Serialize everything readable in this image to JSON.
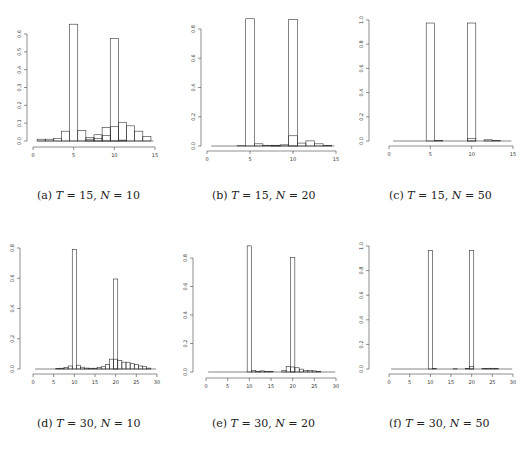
{
  "figure": {
    "panels": [
      {
        "id": "a",
        "caption_label": "(a)",
        "caption_T": "15",
        "caption_N": "10"
      },
      {
        "id": "b",
        "caption_label": "(b)",
        "caption_T": "15",
        "caption_N": "20"
      },
      {
        "id": "c",
        "caption_label": "(c)",
        "caption_T": "15",
        "caption_N": "50"
      },
      {
        "id": "d",
        "caption_label": "(d)",
        "caption_T": "30",
        "caption_N": "10"
      },
      {
        "id": "e",
        "caption_label": "(e)",
        "caption_T": "30",
        "caption_N": "20"
      },
      {
        "id": "f",
        "caption_label": "(f)",
        "caption_T": "30",
        "caption_N": "50"
      }
    ]
  },
  "chart_data": [
    {
      "type": "bar",
      "title": "(a) T = 15, N = 10",
      "xlabel": "",
      "ylabel": "",
      "xlim": [
        0,
        15
      ],
      "ylim": [
        0,
        0.6
      ],
      "xticks": [
        0,
        5,
        10,
        15
      ],
      "yticks": [
        0.0,
        0.1,
        0.2,
        0.3,
        0.4,
        0.5,
        0.6
      ],
      "grid": false,
      "layout": {
        "ox": 27,
        "x0px": 33,
        "x1px": 155,
        "y0px": 141,
        "ytopval": 0.6,
        "ytoppx": 34,
        "axisy": 147
      },
      "series": [
        {
          "name": "changepoint 1",
          "bins": [
            [
              4.5,
              5.5,
              0.655
            ],
            [
              3.5,
              4.5,
              0.055
            ],
            [
              5.5,
              6.5,
              0.06
            ],
            [
              2.5,
              3.5,
              0.015
            ],
            [
              1.5,
              2.5,
              0.01
            ],
            [
              0.5,
              1.5,
              0.01
            ],
            [
              6.5,
              7.5,
              0.01
            ],
            [
              7.5,
              8.5,
              0.015
            ],
            [
              8.5,
              9.5,
              0.03
            ]
          ]
        },
        {
          "name": "changepoint 2",
          "bins": [
            [
              9.5,
              10.5,
              0.575
            ],
            [
              8.5,
              9.5,
              0.075
            ],
            [
              10.5,
              11.5,
              0.105
            ],
            [
              11.5,
              12.5,
              0.085
            ],
            [
              12.5,
              13.5,
              0.055
            ],
            [
              13.5,
              14.5,
              0.025
            ],
            [
              7.5,
              8.5,
              0.035
            ],
            [
              6.5,
              7.5,
              0.02
            ],
            [
              10.5,
              11.5,
              0.005
            ],
            [
              9.5,
              10.5,
              0.08
            ]
          ]
        }
      ]
    },
    {
      "type": "bar",
      "title": "(b) T = 15, N = 20",
      "xlabel": "",
      "ylabel": "",
      "xlim": [
        0,
        15
      ],
      "ylim": [
        0,
        0.8
      ],
      "xticks": [
        0,
        5,
        10,
        15
      ],
      "yticks": [
        0.0,
        0.2,
        0.4,
        0.6,
        0.8
      ],
      "grid": false,
      "layout": {
        "ox": 201,
        "x0px": 207,
        "x1px": 336,
        "y0px": 146,
        "ytopval": 0.8,
        "ytoppx": 29,
        "axisy": 151
      },
      "series": [
        {
          "name": "changepoint 1",
          "bins": [
            [
              4.5,
              5.5,
              0.87
            ],
            [
              5.5,
              6.5,
              0.015
            ],
            [
              6.5,
              7.5,
              0.005
            ],
            [
              7.5,
              8.5,
              0.003
            ],
            [
              3.5,
              4.5,
              0.002
            ]
          ]
        },
        {
          "name": "changepoint 2",
          "bins": [
            [
              9.5,
              10.5,
              0.865
            ],
            [
              9.5,
              10.5,
              0.07
            ],
            [
              10.5,
              11.5,
              0.02
            ],
            [
              11.5,
              12.5,
              0.035
            ],
            [
              12.5,
              13.5,
              0.015
            ],
            [
              13.5,
              14.5,
              0.003
            ],
            [
              8.5,
              9.5,
              0.008
            ],
            [
              7.5,
              8.5,
              0.005
            ]
          ]
        }
      ]
    },
    {
      "type": "bar",
      "title": "(c) T = 15, N = 50",
      "xlabel": "",
      "ylabel": "",
      "xlim": [
        0,
        15
      ],
      "ylim": [
        0,
        1.0
      ],
      "xticks": [
        0,
        5,
        10,
        15
      ],
      "yticks": [
        0.0,
        0.2,
        0.4,
        0.6,
        0.8,
        1.0
      ],
      "grid": false,
      "layout": {
        "ox": 369,
        "x0px": 389,
        "x1px": 513,
        "y0px": 141,
        "ytopval": 1.0,
        "ytoppx": 20,
        "axisy": 146
      },
      "series": [
        {
          "name": "changepoint 1",
          "bins": [
            [
              4.5,
              5.5,
              0.975
            ],
            [
              5.5,
              6.5,
              0.004
            ]
          ]
        },
        {
          "name": "changepoint 2",
          "bins": [
            [
              9.5,
              10.5,
              0.975
            ],
            [
              9.5,
              10.5,
              0.02
            ],
            [
              11.5,
              12.5,
              0.01
            ],
            [
              12.5,
              13.5,
              0.005
            ]
          ]
        }
      ]
    },
    {
      "type": "bar",
      "title": "(d) T = 30, N = 10",
      "xlabel": "",
      "ylabel": "",
      "xlim": [
        0,
        30
      ],
      "ylim": [
        0,
        0.8
      ],
      "xticks": [
        0,
        5,
        10,
        15,
        20,
        25,
        30
      ],
      "yticks": [
        0.0,
        0.2,
        0.4,
        0.6,
        0.8
      ],
      "grid": false,
      "layout": {
        "ox": 20,
        "x0px": 33,
        "x1px": 157,
        "y0px": 369,
        "ytopval": 0.8,
        "ytoppx": 248,
        "axisy": 374
      },
      "series": [
        {
          "name": "changepoint 1",
          "bins": [
            [
              9.5,
              10.5,
              0.79
            ],
            [
              8.5,
              9.5,
              0.02
            ],
            [
              7.5,
              8.5,
              0.01
            ],
            [
              6.5,
              7.5,
              0.005
            ],
            [
              5.5,
              6.5,
              0.004
            ],
            [
              10.5,
              11.5,
              0.025
            ],
            [
              11.5,
              12.5,
              0.012
            ],
            [
              12.5,
              13.5,
              0.006
            ],
            [
              13.5,
              14.5,
              0.005
            ],
            [
              14.5,
              15.5,
              0.005
            ]
          ]
        },
        {
          "name": "changepoint 2",
          "bins": [
            [
              19.5,
              20.5,
              0.595
            ],
            [
              18.5,
              19.5,
              0.065
            ],
            [
              17.5,
              18.5,
              0.03
            ],
            [
              16.5,
              17.5,
              0.015
            ],
            [
              15.5,
              16.5,
              0.01
            ],
            [
              20.5,
              21.5,
              0.055
            ],
            [
              21.5,
              22.5,
              0.045
            ],
            [
              22.5,
              23.5,
              0.045
            ],
            [
              23.5,
              24.5,
              0.035
            ],
            [
              24.5,
              25.5,
              0.03
            ],
            [
              25.5,
              26.5,
              0.02
            ],
            [
              26.5,
              27.5,
              0.018
            ],
            [
              27.5,
              28.5,
              0.006
            ],
            [
              19.5,
              20.5,
              0.065
            ]
          ]
        }
      ]
    },
    {
      "type": "bar",
      "title": "(e) T = 30, N = 20",
      "xlabel": "",
      "ylabel": "",
      "xlim": [
        0,
        30
      ],
      "ylim": [
        0,
        0.8
      ],
      "xticks": [
        0,
        5,
        10,
        15,
        20,
        25,
        30
      ],
      "yticks": [
        0.0,
        0.2,
        0.4,
        0.6,
        0.8
      ],
      "grid": false,
      "layout": {
        "ox": 193,
        "x0px": 206,
        "x1px": 336,
        "y0px": 372,
        "ytopval": 0.8,
        "ytoppx": 258,
        "axisy": 378
      },
      "series": [
        {
          "name": "changepoint 1",
          "bins": [
            [
              9.5,
              10.5,
              0.885
            ],
            [
              10.5,
              11.5,
              0.01
            ],
            [
              11.5,
              12.5,
              0.005
            ],
            [
              12.5,
              13.5,
              0.008
            ],
            [
              13.5,
              14.5,
              0.003
            ],
            [
              14.5,
              15.5,
              0.003
            ]
          ]
        },
        {
          "name": "changepoint 2",
          "bins": [
            [
              19.5,
              20.5,
              0.805
            ],
            [
              18.5,
              19.5,
              0.04
            ],
            [
              17.5,
              18.5,
              0.012
            ],
            [
              20.5,
              21.5,
              0.03
            ],
            [
              21.5,
              22.5,
              0.02
            ],
            [
              22.5,
              23.5,
              0.012
            ],
            [
              23.5,
              24.5,
              0.01
            ],
            [
              24.5,
              25.5,
              0.008
            ],
            [
              25.5,
              26.5,
              0.004
            ],
            [
              19.5,
              20.5,
              0.035
            ]
          ]
        }
      ]
    },
    {
      "type": "bar",
      "title": "(f) T = 30, N = 50",
      "xlabel": "",
      "ylabel": "",
      "xlim": [
        0,
        30
      ],
      "ylim": [
        0,
        1.0
      ],
      "xticks": [
        0,
        5,
        10,
        15,
        20,
        25,
        30
      ],
      "yticks": [
        0.0,
        0.2,
        0.4,
        0.6,
        0.8,
        1.0
      ],
      "grid": false,
      "layout": {
        "ox": 369,
        "x0px": 389,
        "x1px": 513,
        "y0px": 369,
        "ytopval": 1.0,
        "ytoppx": 246,
        "axisy": 374
      },
      "series": [
        {
          "name": "changepoint 1",
          "bins": [
            [
              9.5,
              10.5,
              0.965
            ],
            [
              10.5,
              11.5,
              0.003
            ]
          ]
        },
        {
          "name": "changepoint 2",
          "bins": [
            [
              19.5,
              20.5,
              0.965
            ],
            [
              19.5,
              20.5,
              0.02
            ],
            [
              18.5,
              19.5,
              0.003
            ],
            [
              15.5,
              16.5,
              0.002
            ],
            [
              22.5,
              23.5,
              0.003
            ],
            [
              23.5,
              24.5,
              0.006
            ],
            [
              24.5,
              25.5,
              0.006
            ],
            [
              25.5,
              26.5,
              0.005
            ]
          ]
        }
      ]
    }
  ]
}
